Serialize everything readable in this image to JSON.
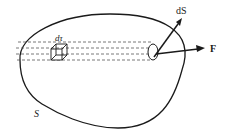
{
  "diagram": {
    "labels": {
      "volume_element": "dτ",
      "surface_element": "dS",
      "force": "F",
      "surface": "S"
    },
    "colors": {
      "stroke": "#1a1a1a",
      "dashed": "#555555",
      "background": "#ffffff"
    }
  }
}
